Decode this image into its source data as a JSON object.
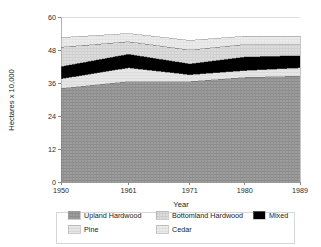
{
  "chart_data": {
    "type": "area",
    "title": "",
    "subtitle": "",
    "xlabel": "Year",
    "ylabel": "Hectares x 10,000",
    "x": [
      1950,
      1961,
      1971,
      1980,
      1989
    ],
    "xtick_labels": [
      "1950",
      "1961",
      "1971",
      "1980",
      "1989"
    ],
    "ytick_labels": [
      "0",
      "12",
      "24",
      "36",
      "48",
      "60"
    ],
    "yticks": [
      0,
      12,
      24,
      36,
      48,
      60
    ],
    "xlim": [
      1950,
      1989
    ],
    "ylim": [
      0,
      60
    ],
    "grid": true,
    "grid_axis": "y",
    "stacked": true,
    "legend_position": "bottom",
    "legend_columns": 3,
    "series": [
      {
        "name": "Upland Hardwood",
        "color": "#9a9a9a",
        "texture": "crosshatch-dense",
        "values": [
          34.0,
          36.5,
          36.5,
          38.0,
          38.5
        ]
      },
      {
        "name": "Pine",
        "color": "#e2e2e2",
        "texture": "plain-light",
        "values": [
          3.5,
          5.0,
          2.5,
          2.5,
          3.0
        ]
      },
      {
        "name": "Mixed",
        "color": "#000000",
        "texture": "solid",
        "values": [
          4.5,
          5.0,
          4.0,
          5.0,
          4.5
        ]
      },
      {
        "name": "Bottomland Hardwood",
        "color": "#d4d4d4",
        "texture": "fine-grid",
        "values": [
          7.0,
          4.5,
          5.0,
          4.5,
          4.0
        ]
      },
      {
        "name": "Cedar",
        "color": "#eaeaea",
        "texture": "plain-lightest",
        "values": [
          3.5,
          3.0,
          3.5,
          3.0,
          3.0
        ]
      }
    ],
    "cumulative_tops": {
      "Upland Hardwood": [
        34.0,
        36.5,
        36.5,
        38.0,
        38.5
      ],
      "Pine": [
        37.5,
        41.5,
        39.0,
        40.5,
        41.5
      ],
      "Mixed": [
        42.0,
        46.5,
        43.0,
        45.5,
        46.0
      ],
      "Bottomland Hardwood": [
        49.0,
        51.0,
        48.0,
        50.0,
        50.0
      ],
      "Cedar": [
        52.5,
        54.0,
        51.5,
        53.0,
        53.0
      ]
    },
    "axis_line_color": "#b0b0b0",
    "grid_color": "#dcdcdc",
    "text_color": "#1a1a1a"
  },
  "legend": {
    "items": [
      {
        "label": "Upland Hardwood",
        "swatch": "#9a9a9a"
      },
      {
        "label": "Bottomland Hardwood",
        "swatch": "#d4d4d4"
      },
      {
        "label": "Mixed",
        "swatch": "#000000"
      },
      {
        "label": "Pine",
        "swatch": "#e2e2e2"
      },
      {
        "label": "Cedar",
        "swatch": "#eaeaea"
      }
    ]
  }
}
